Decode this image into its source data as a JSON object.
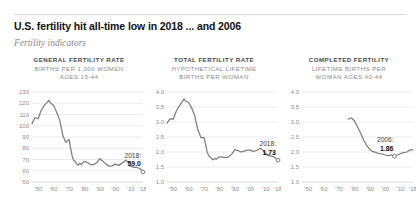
{
  "headline": "U.S. fertility hit all-time low in 2018 ... and 2006",
  "subhead": "Fertility indicators",
  "colors": {
    "line": "#7d7d7d",
    "grid": "#dedede",
    "tick_text": "#8e8e8e",
    "title_text": "#4a4a4a",
    "headline_text": "#111111",
    "subhead_text": "#8a8a8a",
    "background": "#ffffff"
  },
  "chart_data": [
    {
      "type": "line",
      "title": "GENERAL FERTILITY RATE",
      "subtitle_lines": [
        "BIRTHS PER 1,000 WOMEN",
        "AGES 15-44"
      ],
      "xlabel": "",
      "ylabel": "",
      "ylim": [
        50,
        130
      ],
      "yticks": [
        130,
        120,
        110,
        100,
        90,
        80,
        70,
        60,
        50
      ],
      "ytick_labels": [
        "130",
        "120",
        "110",
        "100",
        "90",
        "80",
        "70",
        "60",
        "50"
      ],
      "xlim": [
        1946,
        2018
      ],
      "xticks": [
        1950,
        1960,
        1970,
        1980,
        1990,
        2000,
        2010,
        2018
      ],
      "xtick_labels": [
        "'50",
        "'60",
        "'70",
        "'80",
        "'90",
        "'00",
        "'10",
        "'18"
      ],
      "grid": true,
      "legend": "none",
      "annotation": {
        "year_label": "2018:",
        "value_label": "59.0",
        "x": 2018,
        "y": 59.0
      },
      "x": [
        1946,
        1948,
        1950,
        1952,
        1954,
        1956,
        1957,
        1958,
        1960,
        1962,
        1964,
        1966,
        1968,
        1970,
        1972,
        1973,
        1974,
        1975,
        1976,
        1977,
        1978,
        1979,
        1980,
        1982,
        1984,
        1986,
        1988,
        1990,
        1991,
        1992,
        1994,
        1996,
        1998,
        2000,
        2002,
        2004,
        2006,
        2007,
        2008,
        2010,
        2012,
        2014,
        2016,
        2017,
        2018
      ],
      "values": [
        101.9,
        107.3,
        106.2,
        113.8,
        118.1,
        121.0,
        122.7,
        120.2,
        118.0,
        112.0,
        105.0,
        91.3,
        85.2,
        87.9,
        73.4,
        69.2,
        68.4,
        66.0,
        65.0,
        66.8,
        65.5,
        67.2,
        68.4,
        67.3,
        65.5,
        65.4,
        67.3,
        70.9,
        69.3,
        68.4,
        65.9,
        64.1,
        64.3,
        65.9,
        64.8,
        66.3,
        68.5,
        69.3,
        68.1,
        64.1,
        63.0,
        62.9,
        62.0,
        60.3,
        59.0
      ]
    },
    {
      "type": "line",
      "title": "TOTAL FERTILITY RATE",
      "subtitle_lines": [
        "HYPOTHETICAL LIFETIME",
        "BIRTHS PER WOMAN"
      ],
      "xlabel": "",
      "ylabel": "",
      "ylim": [
        1.0,
        4.0
      ],
      "yticks": [
        4.0,
        3.5,
        3.0,
        2.5,
        2.0,
        1.5,
        1.0
      ],
      "ytick_labels": [
        "4.0",
        "3.5",
        "3.0",
        "2.5",
        "2.0",
        "1.5",
        "1.0"
      ],
      "xlim": [
        1946,
        2018
      ],
      "xticks": [
        1950,
        1960,
        1970,
        1980,
        1990,
        2000,
        2010,
        2018
      ],
      "xtick_labels": [
        "'50",
        "'60",
        "'70",
        "'80",
        "'90",
        "'00",
        "'10",
        "'18"
      ],
      "grid": true,
      "legend": "none",
      "annotation": {
        "year_label": "2018:",
        "value_label": "1.73",
        "x": 2018,
        "y": 1.73
      },
      "x": [
        1946,
        1948,
        1950,
        1952,
        1954,
        1956,
        1957,
        1958,
        1960,
        1962,
        1964,
        1966,
        1968,
        1970,
        1971,
        1972,
        1973,
        1974,
        1975,
        1976,
        1977,
        1978,
        1979,
        1980,
        1982,
        1984,
        1986,
        1988,
        1990,
        1991,
        1992,
        1994,
        1996,
        1998,
        2000,
        2002,
        2004,
        2006,
        2007,
        2008,
        2010,
        2012,
        2014,
        2016,
        2017,
        2018
      ],
      "values": [
        2.96,
        3.11,
        3.09,
        3.36,
        3.54,
        3.69,
        3.77,
        3.7,
        3.65,
        3.47,
        3.21,
        2.74,
        2.48,
        2.48,
        2.27,
        2.01,
        1.88,
        1.84,
        1.77,
        1.74,
        1.79,
        1.76,
        1.81,
        1.84,
        1.83,
        1.81,
        1.84,
        1.93,
        2.08,
        2.06,
        2.05,
        2.0,
        2.03,
        2.06,
        2.06,
        2.02,
        2.05,
        2.11,
        2.12,
        2.07,
        1.93,
        1.88,
        1.86,
        1.82,
        1.77,
        1.73
      ]
    },
    {
      "type": "line",
      "title": "COMPLETED FERTILITY",
      "subtitle_lines": [
        "LIFETIME BIRTHS PER",
        "WOMAN AGES 40-44"
      ],
      "xlabel": "",
      "ylabel": "",
      "ylim": [
        1.0,
        4.0
      ],
      "yticks": [
        4.0,
        3.5,
        3.0,
        2.5,
        2.0,
        1.5,
        1.0
      ],
      "ytick_labels": [
        "4.0",
        "3.5",
        "3.0",
        "2.5",
        "2.0",
        "1.5",
        "1.0"
      ],
      "xlim": [
        1946,
        2018
      ],
      "xticks": [
        1950,
        1960,
        1970,
        1980,
        1990,
        2000,
        2010,
        2018
      ],
      "xtick_labels": [
        "'50",
        "'60",
        "'70",
        "'80",
        "'90",
        "'00",
        "'10",
        "'18"
      ],
      "grid": true,
      "legend": "none",
      "annotation": {
        "year_label": "2006:",
        "value_label": "1.86",
        "x": 2006,
        "y": 1.86
      },
      "x": [
        1976,
        1978,
        1980,
        1982,
        1984,
        1986,
        1988,
        1990,
        1992,
        1994,
        1995,
        1996,
        1998,
        2000,
        2002,
        2004,
        2006,
        2008,
        2010,
        2012,
        2014,
        2016,
        2018
      ],
      "values": [
        3.09,
        3.14,
        3.04,
        2.84,
        2.63,
        2.39,
        2.22,
        2.08,
        2.01,
        1.99,
        1.96,
        1.95,
        1.93,
        1.9,
        1.88,
        1.9,
        1.86,
        1.9,
        1.95,
        1.98,
        2.0,
        2.07,
        2.07
      ]
    }
  ]
}
